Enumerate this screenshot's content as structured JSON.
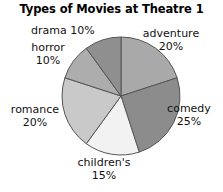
{
  "chart_data": {
    "type": "pie",
    "title": "Types of Movies at Theatre 1",
    "categories": [
      "adventure",
      "comedy",
      "children's",
      "romance",
      "horror",
      "drama"
    ],
    "values": [
      20,
      25,
      15,
      20,
      10,
      10
    ],
    "value_unit": "%",
    "start_angle_deg": 0,
    "direction": "clockwise",
    "legend": "none",
    "labels_position": "outside",
    "slices": [
      {
        "name": "adventure",
        "value": 20,
        "label_line1": "adventure",
        "label_line2": "20%",
        "color": "#a9a9a9",
        "start_pct": 0,
        "end_pct": 20
      },
      {
        "name": "comedy",
        "value": 25,
        "label_line1": "comedy",
        "label_line2": "25%",
        "color": "#8c8c8c",
        "start_pct": 20,
        "end_pct": 45
      },
      {
        "name": "children's",
        "value": 15,
        "label_line1": "children's",
        "label_line2": "15%",
        "color": "#f2f2f2",
        "start_pct": 45,
        "end_pct": 60
      },
      {
        "name": "romance",
        "value": 20,
        "label_line1": "romance",
        "label_line2": "20%",
        "color": "#c9c9c9",
        "start_pct": 60,
        "end_pct": 80
      },
      {
        "name": "horror",
        "value": 10,
        "label_line1": "horror",
        "label_line2": "10%",
        "color": "#adadad",
        "start_pct": 80,
        "end_pct": 90
      },
      {
        "name": "drama",
        "value": 10,
        "label_line1": "drama 10%",
        "label_line2": "",
        "color": "#8f8f8f",
        "start_pct": 90,
        "end_pct": 100
      }
    ],
    "geometry": {
      "center_x": 121,
      "center_y": 96,
      "radius": 59
    },
    "stroke_color": "#555555",
    "background": "#ffffff"
  }
}
